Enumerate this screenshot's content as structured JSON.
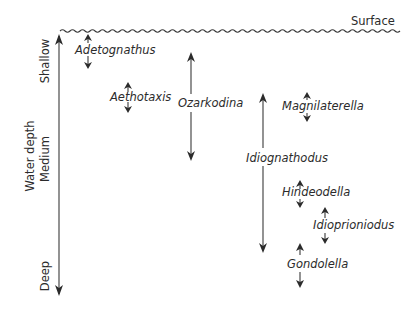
{
  "diagram": {
    "title": "",
    "surface_label": "Surface",
    "axis": {
      "title": "Water depth",
      "levels": [
        "Shallow",
        "Medium",
        "Deep"
      ],
      "direction": "increasing depth downward"
    },
    "colors": {
      "ink": "#2b2b2b",
      "background": "#ffffff"
    },
    "taxa": [
      {
        "name": "Adetognathus",
        "range": "shallow (near surface)",
        "arrow": "short double"
      },
      {
        "name": "Aethotaxis",
        "range": "shallow",
        "arrow": "short double"
      },
      {
        "name": "Ozarkodina",
        "range": "shallow to medium",
        "arrow": "long double"
      },
      {
        "name": "Magnilaterella",
        "range": "shallow-medium",
        "arrow": "short double"
      },
      {
        "name": "Idiognathodus",
        "range": "shallow-medium to deep",
        "arrow": "long double"
      },
      {
        "name": "Hindeodella",
        "range": "medium-deep",
        "arrow": "short double"
      },
      {
        "name": "Idioprioniodus",
        "range": "deep",
        "arrow": "short double"
      },
      {
        "name": "Gondolella",
        "range": "deep",
        "arrow": "short double"
      }
    ]
  }
}
